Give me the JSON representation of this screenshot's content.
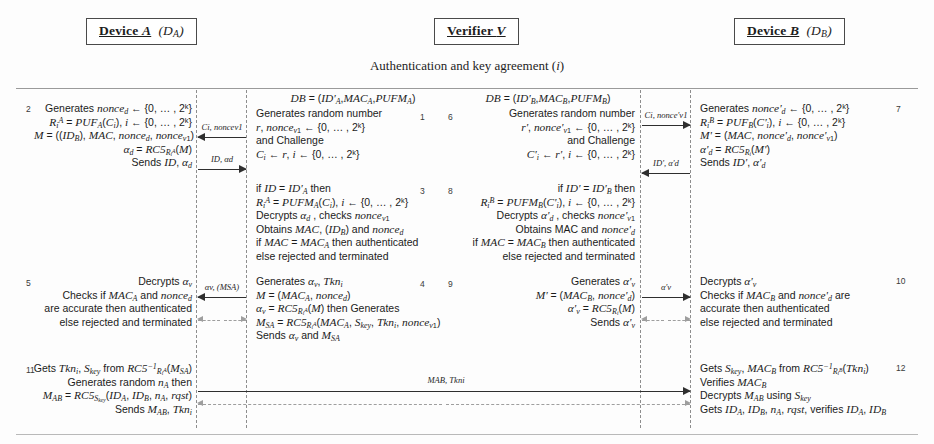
{
  "diagram": {
    "phase_title": "Authentication and key agreement (i)",
    "parties": {
      "device_a": {
        "name": "Device A",
        "paren": "(DA)"
      },
      "verifier": {
        "name": "Verifier V",
        "paren": ""
      },
      "device_b": {
        "name": "Device B",
        "paren": "(DB)"
      }
    },
    "db_headers": {
      "left": "DB = (ID'A, MACA, PUFMA)",
      "right": "DB = (ID'B, MACB, PUFMB)"
    },
    "step_numbers": {
      "a_row1": "2",
      "a_row3": "5",
      "a_row4": "11",
      "v_row1_left": "1",
      "v_row1_right": "6",
      "v_row2_left": "3",
      "v_row2_right": "8",
      "v_row3_left": "4",
      "v_row3_right": "9",
      "b_row1": "7",
      "b_row3": "10",
      "b_row4": "12"
    },
    "blocks": {
      "a_step2": [
        "Generates nonced ← {0, … , 2k}",
        "RiA = PUFA(Ci), i ← {0, … , 2k}",
        "M = ((IDB), MAC, nonced, noncev1)",
        "αd = RC5RiA(M)",
        "Sends ID, αd"
      ],
      "v_step1": [
        "Generates random number",
        "r, noncev1 ← {0, … , 2k}",
        "and Challenge",
        "Ci ← r, i ← {0, … , 2k}"
      ],
      "v_step6": [
        "Generates random number",
        "r', nonce'v1 ← {0, … , 2k}",
        "and Challenge",
        "C'i ← r', i ← {0, … , 2k}"
      ],
      "b_step7": [
        "Generates nonce'd ← {0, … , 2k}",
        "RiB = PUFB(C'i), i ← {0, … , 2k}",
        "M' = (MAC, nonce'd, nonce'v1)",
        "α'd = RC5Ri(M')",
        "Sends ID', α'd"
      ],
      "v_step3": [
        "if ID = ID'A then",
        "RiA = PUFMA(Ci), i ← {0, … , 2k}",
        "Decrypts αd , checks noncev1",
        "Obtains MAC, (IDB) and nonced",
        "if MAC = MACA then authenticated",
        "else rejected and terminated"
      ],
      "v_step8": [
        "if ID' = ID'B then",
        "RiB = PUFMB(C'i), i ← {0, … , 2k}",
        "Decrypts α'd , checks nonce'v1",
        "Obtains MAC and nonce'd",
        "if MAC = MACB then authenticated",
        "else rejected and terminated"
      ],
      "a_step5": [
        "Decrypts αv",
        "Checks if MACA and nonced",
        "are accurate then authenticated",
        "else rejected and terminated"
      ],
      "v_step4": [
        "Generates αv, Tkni",
        "M = (MACA, nonced)",
        "αv = RC5RiA(M) then Generates",
        "MSA = RC5RiA(MACA, Skey, Tkni, noncev1)",
        "Sends αv and MSA"
      ],
      "v_step9": [
        "Generates α'v",
        "M' = (MACB, nonce'd)",
        "α'v = RC5Ri(M)",
        "Sends α'v"
      ],
      "b_step10": [
        "Decrypts α'v",
        "Checks if MACB and nonce'd are",
        "accurate then authenticated",
        "else rejected and terminated"
      ],
      "a_step11": [
        "Gets Tkni, Skey from RC5⁻¹RiA(MSA)",
        "Generates random nA then",
        "MAB = RC5Skey(IDA, IDB, nA, rqst)",
        "Sends MAB, Tkni"
      ],
      "b_step12": [
        "Gets Skey, MACB from RC5⁻¹RiB(Tkni)",
        "Verifies MACB",
        "Decrypts MAB using Skey",
        "Gets IDA, IDB, nA, rqst, verifies IDA, IDB"
      ]
    },
    "arrow_labels": {
      "v_to_a_challenge": "Ci, noncev1",
      "a_to_v_id": "ID, αd",
      "v_to_b_challenge": "Ci, nonce'v1",
      "b_to_v_id": "ID', α'd",
      "v_to_a_alpha": "αv, (MSA)",
      "v_to_b_alpha": "α'v",
      "a_to_b_mab": "MAB, Tkni"
    }
  }
}
